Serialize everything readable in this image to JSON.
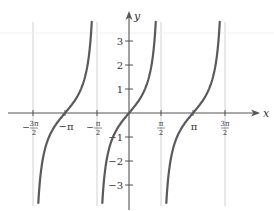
{
  "chart_data": {
    "type": "line",
    "title": "",
    "function": "y = tan(x)",
    "xlabel": "x",
    "ylabel": "y",
    "xlim": [
      -4.93,
      4.93
    ],
    "ylim": [
      -3.75,
      3.8
    ],
    "x_ticks": [
      {
        "value": -4.7124,
        "label_num": "3π",
        "label_den": "2",
        "sign": "−",
        "fraction": true
      },
      {
        "value": -3.1416,
        "label": "−π",
        "fraction": false
      },
      {
        "value": -1.5708,
        "label_num": "π",
        "label_den": "2",
        "sign": "−",
        "fraction": true
      },
      {
        "value": 1.5708,
        "label_num": "π",
        "label_den": "2",
        "sign": "",
        "fraction": true
      },
      {
        "value": 3.1416,
        "label": "π",
        "fraction": false
      },
      {
        "value": 4.7124,
        "label_num": "3π",
        "label_den": "2",
        "sign": "",
        "fraction": true
      }
    ],
    "y_ticks": [
      {
        "value": 3,
        "label": "3"
      },
      {
        "value": 2,
        "label": "2"
      },
      {
        "value": 1,
        "label": "1"
      },
      {
        "value": -1,
        "label": "−1"
      },
      {
        "value": -2,
        "label": "−2"
      },
      {
        "value": -3,
        "label": "−3"
      }
    ],
    "asymptotes": [
      -4.7124,
      -1.5708,
      1.5708,
      4.7124
    ],
    "branches": [
      {
        "center": -3.1416,
        "x_from": -4.412,
        "x_to": 1.32,
        "note": "branch between −3π/2 and −π/2"
      },
      {
        "center": 0,
        "x_from": -1.3078,
        "x_to": 1.32
      },
      {
        "center": 3.1416,
        "x_from": 1.8338,
        "x_to": 4.4616
      }
    ],
    "series": [
      {
        "name": "tan x",
        "color": "#5a5a5a"
      }
    ],
    "grid": false,
    "legend": null
  },
  "axes": {
    "x_label": "x",
    "y_label": "y"
  },
  "colors": {
    "curve": "#5a5a5a",
    "axis": "#555555",
    "asymptote": "#d9d9d9",
    "text": "#333333"
  }
}
